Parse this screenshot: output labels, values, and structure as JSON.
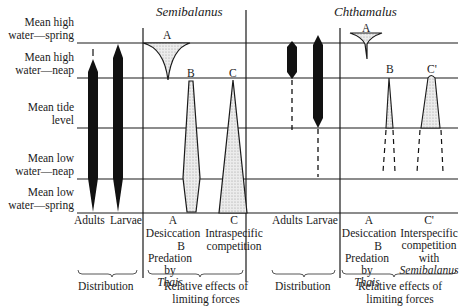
{
  "diagram": {
    "titles": {
      "semibalanus": "Semibalanus",
      "chthamalus": "Chthamalus"
    },
    "tide_levels": [
      {
        "line1": "Mean high",
        "line2": "water—spring"
      },
      {
        "line1": "Mean high",
        "line2": "water—neap"
      },
      {
        "line1": "Mean tide",
        "line2": "level"
      },
      {
        "line1": "Mean low",
        "line2": "water—neap"
      },
      {
        "line1": "Mean low",
        "line2": "water—spring"
      }
    ],
    "semibalanus": {
      "distribution": {
        "adults": "Adults",
        "larvae": "Larvae",
        "group": "Distribution"
      },
      "factors": {
        "a_letter": "A",
        "a_label": "Desiccation",
        "b_letter": "B",
        "b_label1": "Predation",
        "b_label2": "by",
        "b_label3": "Thais",
        "c_letter": "C",
        "c_label1": "Intraspecific",
        "c_label2": "competition",
        "group1": "Relative effects of",
        "group2": "limiting forces"
      },
      "curve_labels": {
        "a": "A",
        "b": "B",
        "c": "C"
      }
    },
    "chthamalus": {
      "distribution": {
        "adults": "Adults",
        "larvae": "Larvae",
        "group": "Distribution"
      },
      "factors": {
        "a_letter": "A",
        "a_label": "Desiccation",
        "b_letter": "B",
        "b_label1": "Predation",
        "b_label2": "by",
        "b_label3": "Thais",
        "c_letter": "C'",
        "c_label1": "Interspecific",
        "c_label2": "competition",
        "c_label3": "with",
        "c_label4": "Semibalanus",
        "group1": "Relative effects of",
        "group2": "limiting forces"
      },
      "curve_labels": {
        "a": "A",
        "b": "B",
        "c": "C'"
      }
    },
    "colors": {
      "line": "#1a1a1a",
      "fill_dark": "#111111",
      "stipple": "#d6d6d6"
    }
  }
}
